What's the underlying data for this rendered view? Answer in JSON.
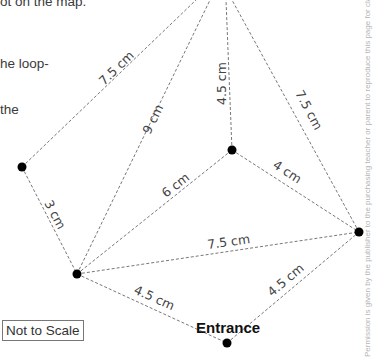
{
  "text_fragments": [
    "ot on the map.",
    "he loop-",
    "the"
  ],
  "edges": [
    {
      "label": "7.5 cm"
    },
    {
      "label": "9 cm"
    },
    {
      "label": "4.5 cm"
    },
    {
      "label": "7.5 cm"
    },
    {
      "label": "3 cm"
    },
    {
      "label": "6 cm"
    },
    {
      "label": "4 cm"
    },
    {
      "label": "7.5 cm"
    },
    {
      "label": "4.5 cm"
    },
    {
      "label": "4.5 cm"
    }
  ],
  "entrance_label": "Entrance",
  "scale_note": "Not to Scale",
  "permission_text": "Permission is given by the publisher to the purchasing teacher or parent to reproduce this page for classroom use"
}
